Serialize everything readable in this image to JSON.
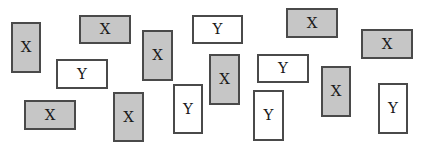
{
  "diagram": {
    "colors": {
      "x_fill": "#c6c6c6",
      "y_fill": "#ffffff",
      "border": "#4a4a4a",
      "text": "#1a1a1a"
    },
    "cards": [
      {
        "label": "X",
        "type": "x",
        "x": 11,
        "y": 22,
        "w": 30,
        "h": 51
      },
      {
        "label": "X",
        "type": "x",
        "x": 79,
        "y": 15,
        "w": 52,
        "h": 29
      },
      {
        "label": "Y",
        "type": "y",
        "x": 56,
        "y": 59,
        "w": 52,
        "h": 30
      },
      {
        "label": "X",
        "type": "x",
        "x": 142,
        "y": 30,
        "w": 31,
        "h": 51
      },
      {
        "label": "Y",
        "type": "y",
        "x": 192,
        "y": 15,
        "w": 51,
        "h": 29
      },
      {
        "label": "X",
        "type": "x",
        "x": 209,
        "y": 54,
        "w": 31,
        "h": 51
      },
      {
        "label": "X",
        "type": "x",
        "x": 286,
        "y": 8,
        "w": 52,
        "h": 30
      },
      {
        "label": "X",
        "type": "x",
        "x": 361,
        "y": 29,
        "w": 52,
        "h": 30
      },
      {
        "label": "Y",
        "type": "y",
        "x": 257,
        "y": 54,
        "w": 52,
        "h": 29
      },
      {
        "label": "Y",
        "type": "y",
        "x": 253,
        "y": 90,
        "w": 31,
        "h": 51
      },
      {
        "label": "X",
        "type": "x",
        "x": 321,
        "y": 66,
        "w": 30,
        "h": 51
      },
      {
        "label": "Y",
        "type": "y",
        "x": 378,
        "y": 83,
        "w": 30,
        "h": 51
      },
      {
        "label": "X",
        "type": "x",
        "x": 24,
        "y": 100,
        "w": 52,
        "h": 30
      },
      {
        "label": "X",
        "type": "x",
        "x": 113,
        "y": 92,
        "w": 31,
        "h": 50
      },
      {
        "label": "Y",
        "type": "y",
        "x": 173,
        "y": 84,
        "w": 30,
        "h": 50
      }
    ]
  }
}
